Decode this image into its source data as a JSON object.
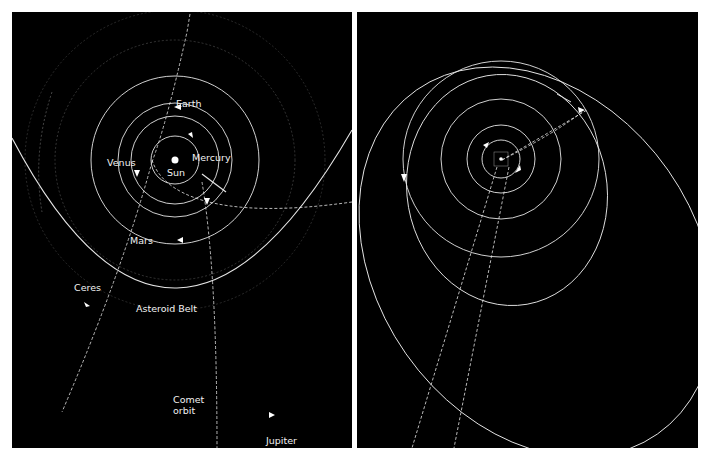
{
  "colors": {
    "background": "#000000",
    "orbit": "#e6e6e6",
    "frame": "#ffffff",
    "label": "#f2f2f2"
  },
  "inner_panel": {
    "labels": {
      "earth": "Earth",
      "venus": "Venus",
      "mercury": "Mercury",
      "sun": "Sun",
      "mars": "Mars",
      "ceres": "Ceres",
      "asteroid_belt": "Asteroid Belt",
      "comet_orbit": "Comet\norbit",
      "jupiter": "Jupiter"
    }
  },
  "outer_panel": {
    "labels": {
      "kuiper_belt": "Kuiper Belt",
      "halleys_comet": "Halley's\ncomet",
      "saturn": "Saturn",
      "pluto": "Pluto",
      "jupiter": "Jupiter",
      "uranus": "Uranus",
      "neptune": "Neptune",
      "comet_orbit": "Comet\norbit",
      "eris": "Eris"
    }
  }
}
